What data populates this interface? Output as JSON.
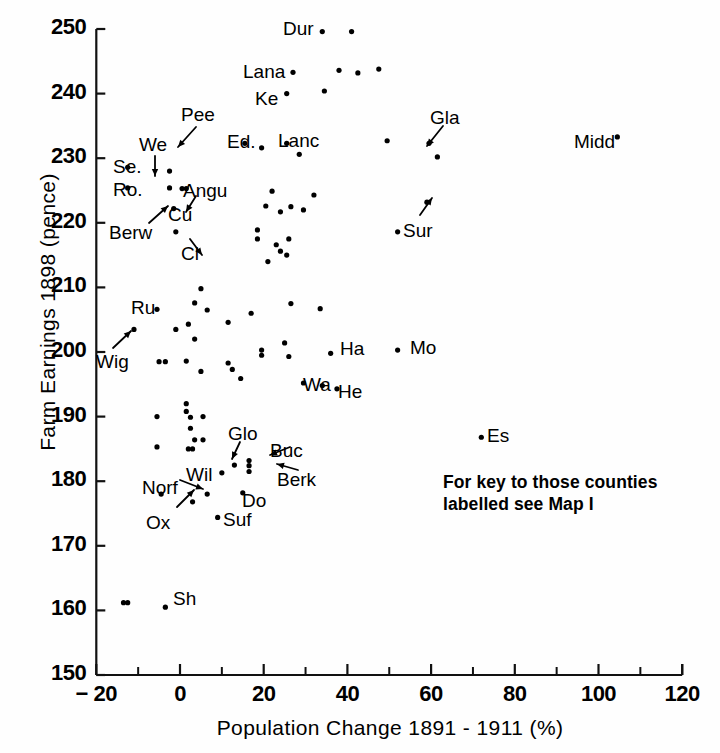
{
  "chart_data": {
    "type": "scatter",
    "title": "",
    "xlabel": "Population Change 1891 - 1911 (%)",
    "ylabel": "Farm Earnings 1898 (pence)",
    "xlim": [
      -20,
      120
    ],
    "ylim": [
      150,
      250
    ],
    "xticks": [
      -20,
      0,
      20,
      40,
      60,
      80,
      100,
      120
    ],
    "xtick_labels": [
      "− 20",
      "0",
      "20",
      "40",
      "60",
      "80",
      "100",
      "120"
    ],
    "yticks": [
      150,
      160,
      170,
      180,
      190,
      200,
      210,
      220,
      230,
      240,
      250
    ],
    "ytick_labels": [
      "150",
      "160",
      "170",
      "180",
      "190",
      "200",
      "210",
      "220",
      "230",
      "240",
      "250"
    ],
    "minor_xticks": [
      -10,
      10,
      30,
      50,
      70,
      90,
      110
    ],
    "grid": false,
    "legend": null,
    "marker_color": "#000000",
    "annotation": "For key to those counties\nlabelled see Map I",
    "points": [
      {
        "x": 34,
        "y": 249.6,
        "label": "Dur",
        "label_pos": "left"
      },
      {
        "x": 41,
        "y": 249.6,
        "label": "",
        "label_pos": ""
      },
      {
        "x": 27,
        "y": 243.3,
        "label": "Lana",
        "label_pos": "left"
      },
      {
        "x": 38,
        "y": 243.6,
        "label": "",
        "label_pos": ""
      },
      {
        "x": 42.5,
        "y": 243.2,
        "label": "",
        "label_pos": ""
      },
      {
        "x": 47.5,
        "y": 243.8,
        "label": "",
        "label_pos": ""
      },
      {
        "x": 25.5,
        "y": 240.0,
        "label": "Ke",
        "label_pos": "left"
      },
      {
        "x": 34.5,
        "y": 240.4,
        "label": "",
        "label_pos": ""
      },
      {
        "x": 15.5,
        "y": 232.3,
        "label": "Pee",
        "label_pos": "arrow-up"
      },
      {
        "x": 25.5,
        "y": 232.3,
        "label": "Lanc",
        "label_pos": "right"
      },
      {
        "x": 19.5,
        "y": 231.6,
        "label": "Ed",
        "label_pos": "left"
      },
      {
        "x": 49.5,
        "y": 232.7,
        "label": "",
        "label_pos": ""
      },
      {
        "x": 28.5,
        "y": 230.6,
        "label": "",
        "label_pos": ""
      },
      {
        "x": 104.5,
        "y": 233.3,
        "label": "Midd",
        "label_pos": "left"
      },
      {
        "x": 59.5,
        "y": 232.3,
        "label": "Gla",
        "label_pos": "arrow-up"
      },
      {
        "x": 61.5,
        "y": 230.2,
        "label": "",
        "label_pos": ""
      },
      {
        "x": -12.5,
        "y": 228.6,
        "label": "Se",
        "label_pos": "left"
      },
      {
        "x": -12.5,
        "y": 225.4,
        "label": "Ro",
        "label_pos": "left"
      },
      {
        "x": -2.5,
        "y": 228.0,
        "label": "We",
        "label_pos": "arrow-down"
      },
      {
        "x": -2.5,
        "y": 225.4,
        "label": "",
        "label_pos": ""
      },
      {
        "x": 0.5,
        "y": 225.3,
        "label": "Angu",
        "label_pos": "right"
      },
      {
        "x": 1.5,
        "y": 225.3,
        "label": "",
        "label_pos": ""
      },
      {
        "x": 32.0,
        "y": 224.3,
        "label": "",
        "label_pos": ""
      },
      {
        "x": 22.0,
        "y": 224.9,
        "label": "",
        "label_pos": ""
      },
      {
        "x": -1.5,
        "y": 222.2,
        "label": "Berw",
        "label_pos": "arrow-ne"
      },
      {
        "x": 20.5,
        "y": 222.6,
        "label": "",
        "label_pos": ""
      },
      {
        "x": 24.0,
        "y": 221.7,
        "label": "",
        "label_pos": ""
      },
      {
        "x": 26.5,
        "y": 222.5,
        "label": "",
        "label_pos": ""
      },
      {
        "x": 29.5,
        "y": 222.0,
        "label": "",
        "label_pos": ""
      },
      {
        "x": 59.0,
        "y": 223.2,
        "label": "Sur",
        "label_pos": "arrow-up2"
      },
      {
        "x": -1.0,
        "y": 218.6,
        "label": "Cl",
        "label_pos": "arrow-se"
      },
      {
        "x": 18.5,
        "y": 218.9,
        "label": "",
        "label_pos": ""
      },
      {
        "x": 18.5,
        "y": 217.5,
        "label": "",
        "label_pos": ""
      },
      {
        "x": 26.0,
        "y": 217.5,
        "label": "",
        "label_pos": ""
      },
      {
        "x": 52.0,
        "y": 218.6,
        "label": "",
        "label_pos": ""
      },
      {
        "x": 23.0,
        "y": 216.6,
        "label": "",
        "label_pos": ""
      },
      {
        "x": 24.0,
        "y": 215.6,
        "label": "",
        "label_pos": ""
      },
      {
        "x": 21.0,
        "y": 214.0,
        "label": "",
        "label_pos": ""
      },
      {
        "x": 25.5,
        "y": 215.0,
        "label": "",
        "label_pos": ""
      },
      {
        "x": 5.0,
        "y": 209.8,
        "label": "",
        "label_pos": ""
      },
      {
        "x": 3.5,
        "y": 207.6,
        "label": "",
        "label_pos": ""
      },
      {
        "x": -5.5,
        "y": 206.6,
        "label": "Ru",
        "label_pos": "left"
      },
      {
        "x": 6.5,
        "y": 206.5,
        "label": "",
        "label_pos": ""
      },
      {
        "x": 17.0,
        "y": 206.0,
        "label": "",
        "label_pos": ""
      },
      {
        "x": 26.5,
        "y": 207.5,
        "label": "",
        "label_pos": ""
      },
      {
        "x": 33.5,
        "y": 206.7,
        "label": "",
        "label_pos": ""
      },
      {
        "x": 11.5,
        "y": 204.6,
        "label": "",
        "label_pos": ""
      },
      {
        "x": -11.0,
        "y": 203.5,
        "label": "Wig",
        "label_pos": "arrow-ne2"
      },
      {
        "x": -1.0,
        "y": 203.5,
        "label": "",
        "label_pos": ""
      },
      {
        "x": 2.0,
        "y": 204.3,
        "label": "",
        "label_pos": ""
      },
      {
        "x": 3.5,
        "y": 202.0,
        "label": "",
        "label_pos": ""
      },
      {
        "x": 19.5,
        "y": 200.3,
        "label": "",
        "label_pos": ""
      },
      {
        "x": 19.5,
        "y": 199.5,
        "label": "",
        "label_pos": ""
      },
      {
        "x": 25.0,
        "y": 201.4,
        "label": "",
        "label_pos": ""
      },
      {
        "x": 26.0,
        "y": 199.3,
        "label": "",
        "label_pos": ""
      },
      {
        "x": 36.0,
        "y": 199.8,
        "label": "Ha",
        "label_pos": "right"
      },
      {
        "x": 52.0,
        "y": 200.3,
        "label": "Mo",
        "label_pos": "right"
      },
      {
        "x": -5.0,
        "y": 198.5,
        "label": "",
        "label_pos": ""
      },
      {
        "x": -3.5,
        "y": 198.5,
        "label": "",
        "label_pos": ""
      },
      {
        "x": 1.5,
        "y": 198.6,
        "label": "",
        "label_pos": ""
      },
      {
        "x": 5.0,
        "y": 197.0,
        "label": "",
        "label_pos": ""
      },
      {
        "x": 11.5,
        "y": 198.3,
        "label": "",
        "label_pos": ""
      },
      {
        "x": 12.5,
        "y": 197.3,
        "label": "",
        "label_pos": ""
      },
      {
        "x": 14.5,
        "y": 195.9,
        "label": "",
        "label_pos": ""
      },
      {
        "x": 29.5,
        "y": 195.2,
        "label": "",
        "label_pos": ""
      },
      {
        "x": 34.0,
        "y": 194.8,
        "label": "Wa",
        "label_pos": "left2"
      },
      {
        "x": 37.5,
        "y": 194.3,
        "label": "He",
        "label_pos": "right"
      },
      {
        "x": 1.5,
        "y": 192.0,
        "label": "",
        "label_pos": ""
      },
      {
        "x": 1.5,
        "y": 190.8,
        "label": "",
        "label_pos": ""
      },
      {
        "x": -5.5,
        "y": 190.0,
        "label": "",
        "label_pos": ""
      },
      {
        "x": 2.5,
        "y": 189.9,
        "label": "",
        "label_pos": ""
      },
      {
        "x": 5.5,
        "y": 190.0,
        "label": "",
        "label_pos": ""
      },
      {
        "x": 2.5,
        "y": 188.2,
        "label": "",
        "label_pos": ""
      },
      {
        "x": 3.5,
        "y": 186.4,
        "label": "",
        "label_pos": ""
      },
      {
        "x": 5.5,
        "y": 186.4,
        "label": "",
        "label_pos": ""
      },
      {
        "x": -5.5,
        "y": 185.3,
        "label": "",
        "label_pos": ""
      },
      {
        "x": 2.0,
        "y": 185.0,
        "label": "",
        "label_pos": ""
      },
      {
        "x": 3.0,
        "y": 185.0,
        "label": "",
        "label_pos": ""
      },
      {
        "x": 72.0,
        "y": 186.8,
        "label": "Es",
        "label_pos": "right"
      },
      {
        "x": 13.0,
        "y": 182.5,
        "label": "Glo",
        "label_pos": "arrow-up3"
      },
      {
        "x": 16.5,
        "y": 183.2,
        "label": "Buc",
        "label_pos": "arrow-right"
      },
      {
        "x": 16.5,
        "y": 181.5,
        "label": "Berk",
        "label_pos": "arrow-right2"
      },
      {
        "x": 16.5,
        "y": 182.4,
        "label": "",
        "label_pos": ""
      },
      {
        "x": 10.0,
        "y": 181.3,
        "label": "Wil",
        "label_pos": "left"
      },
      {
        "x": 15.0,
        "y": 178.2,
        "label": "Do",
        "label_pos": "right"
      },
      {
        "x": 6.5,
        "y": 178.0,
        "label": "Norf",
        "label_pos": "arrow-right3"
      },
      {
        "x": -4.5,
        "y": 178.0,
        "label": "",
        "label_pos": ""
      },
      {
        "x": 3.0,
        "y": 176.8,
        "label": "Ox",
        "label_pos": "arrow-ne3"
      },
      {
        "x": 9.0,
        "y": 174.4,
        "label": "Suf",
        "label_pos": "right"
      },
      {
        "x": -13.5,
        "y": 161.2,
        "label": "",
        "label_pos": ""
      },
      {
        "x": -12.5,
        "y": 161.2,
        "label": "",
        "label_pos": ""
      },
      {
        "x": -3.5,
        "y": 160.5,
        "label": "Sh",
        "label_pos": "right"
      }
    ],
    "callout_labels": [
      {
        "text": "Dur",
        "x": 283,
        "y": 18
      },
      {
        "text": "Lana",
        "x": 243,
        "y": 61
      },
      {
        "text": "Ke",
        "x": 255,
        "y": 88
      },
      {
        "text": "Pee",
        "x": 181,
        "y": 104
      },
      {
        "text": "We",
        "x": 139,
        "y": 134
      },
      {
        "text": "Ed.",
        "x": 227,
        "y": 131
      },
      {
        "text": "Lanc",
        "x": 278,
        "y": 130
      },
      {
        "text": "Gla",
        "x": 430,
        "y": 107
      },
      {
        "text": "Midd",
        "x": 574,
        "y": 131
      },
      {
        "text": "Se.",
        "x": 113,
        "y": 156
      },
      {
        "text": "Ro.",
        "x": 113,
        "y": 179
      },
      {
        "text": "Angu",
        "x": 183,
        "y": 180
      },
      {
        "text": "Cu",
        "x": 168,
        "y": 204
      },
      {
        "text": "Berw",
        "x": 109,
        "y": 222
      },
      {
        "text": "Sur",
        "x": 403,
        "y": 220
      },
      {
        "text": "Cl",
        "x": 181,
        "y": 243
      },
      {
        "text": "Ru",
        "x": 131,
        "y": 297
      },
      {
        "text": "Wig",
        "x": 96,
        "y": 351
      },
      {
        "text": "Ha",
        "x": 340,
        "y": 338
      },
      {
        "text": "Mo",
        "x": 410,
        "y": 337
      },
      {
        "text": "Wa",
        "x": 303,
        "y": 374
      },
      {
        "text": "He",
        "x": 338,
        "y": 381
      },
      {
        "text": "Es",
        "x": 487,
        "y": 425
      },
      {
        "text": "Glo",
        "x": 228,
        "y": 423
      },
      {
        "text": "Buc",
        "x": 270,
        "y": 440
      },
      {
        "text": "Berk",
        "x": 277,
        "y": 469
      },
      {
        "text": "Wil",
        "x": 186,
        "y": 464
      },
      {
        "text": "Do",
        "x": 242,
        "y": 490
      },
      {
        "text": "Norf",
        "x": 142,
        "y": 477
      },
      {
        "text": "Ox",
        "x": 146,
        "y": 512
      },
      {
        "text": "Suf",
        "x": 223,
        "y": 509
      },
      {
        "text": "Sh",
        "x": 173,
        "y": 588
      }
    ]
  },
  "axes": {
    "y_title": "Farm Earnings 1898 (pence)",
    "x_title": "Population Change 1891 - 1911 (%)"
  },
  "note": {
    "line1": "For key to those counties",
    "line2": "labelled see Map I"
  }
}
